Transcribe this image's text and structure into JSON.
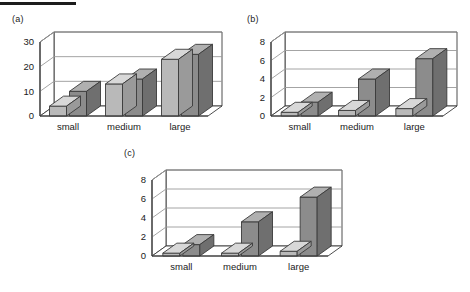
{
  "figure": {
    "rule_present": true,
    "background": "#ffffff"
  },
  "colors": {
    "series_light_front": "#b9b9b9",
    "series_light_top": "#d8d8d8",
    "series_light_side": "#9a9a9a",
    "series_dark_front": "#8c8c8c",
    "series_dark_top": "#b0b0b0",
    "series_dark_side": "#6f6f6f",
    "floor": "#ffffff",
    "wall": "#ffffff",
    "grid": "#9a9a9a",
    "outline": "#3a3a3a",
    "text": "#1a1a1a"
  },
  "panels": [
    {
      "id": "a",
      "label": "(a)",
      "chart_data": {
        "type": "bar",
        "title": "(a)",
        "xlabel": "",
        "ylabel": "",
        "categories": [
          "small",
          "medium",
          "large"
        ],
        "yticks": [
          0,
          10,
          20,
          30
        ],
        "ylim": [
          0,
          30
        ],
        "grid": true,
        "legend": "none",
        "series": [
          {
            "name": "series-1",
            "values": [
              4,
              13,
              23
            ]
          },
          {
            "name": "series-2",
            "values": [
              10,
              15,
              25
            ]
          }
        ]
      }
    },
    {
      "id": "b",
      "label": "(b)",
      "chart_data": {
        "type": "bar",
        "title": "(b)",
        "xlabel": "",
        "ylabel": "",
        "categories": [
          "small",
          "medium",
          "large"
        ],
        "yticks": [
          0,
          2,
          4,
          6,
          8
        ],
        "ylim": [
          0,
          8
        ],
        "grid": true,
        "legend": "none",
        "series": [
          {
            "name": "series-1",
            "values": [
              0.4,
              0.6,
              0.8
            ]
          },
          {
            "name": "series-2",
            "values": [
              1.5,
              4.0,
              6.2
            ]
          }
        ]
      }
    },
    {
      "id": "c",
      "label": "(c)",
      "chart_data": {
        "type": "bar",
        "title": "(c)",
        "xlabel": "",
        "ylabel": "",
        "categories": [
          "small",
          "medium",
          "large"
        ],
        "yticks": [
          0,
          2,
          4,
          6,
          8
        ],
        "ylim": [
          0,
          8
        ],
        "grid": true,
        "legend": "none",
        "series": [
          {
            "name": "series-1",
            "values": [
              0.3,
              0.3,
              0.5
            ]
          },
          {
            "name": "series-2",
            "values": [
              1.2,
              3.6,
              6.2
            ]
          }
        ]
      }
    }
  ]
}
